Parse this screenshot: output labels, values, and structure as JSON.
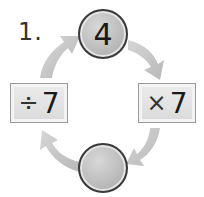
{
  "problem": {
    "number_label": "1.",
    "cycle": {
      "top_circle": {
        "value": "4"
      },
      "right_box": {
        "operator": "×",
        "operand": "7"
      },
      "bottom_circle": {
        "value": ""
      },
      "left_box": {
        "operator": "÷",
        "operand": "7"
      }
    },
    "arrow_color": "#c8c8c8",
    "circle_color": "#b8b8b8"
  }
}
